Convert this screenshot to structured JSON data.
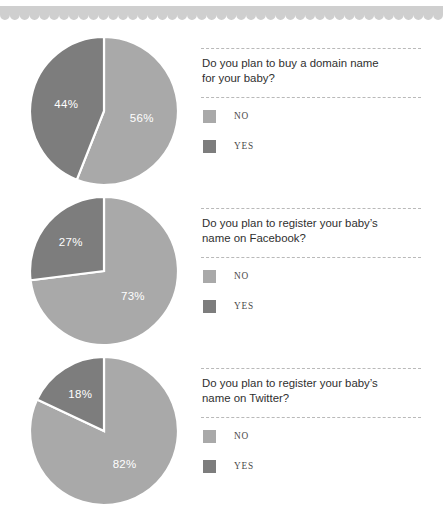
{
  "decoration": {
    "scallop_color": "#cfcfcf",
    "scallop_count": 45
  },
  "palette": {
    "no_color": "#a9a9a9",
    "yes_color": "#7d7d7d",
    "divider_color": "#ffffff",
    "label_color": "#ffffff",
    "rule_color": "#b9b9b9",
    "question_color": "#2f2f2f",
    "legend_text_color": "#4a4a4a"
  },
  "legend_labels": {
    "no": "NO",
    "yes": "YES"
  },
  "chart_data": [
    {
      "type": "pie",
      "title": "Do you plan to buy a domain name for your baby?",
      "question_line1": "Do you plan to buy a domain name",
      "question_line2": "for your baby?",
      "categories": [
        "NO",
        "YES"
      ],
      "values": [
        56,
        44
      ],
      "labels": [
        "56%",
        "44%"
      ],
      "colors": [
        "#a9a9a9",
        "#7d7d7d"
      ],
      "legend": [
        "NO",
        "YES"
      ],
      "legend_position": "right"
    },
    {
      "type": "pie",
      "title": "Do you plan to register your baby's name on Facebook?",
      "question_line1": "Do you plan to register your baby’s",
      "question_line2": "name on Facebook?",
      "categories": [
        "NO",
        "YES"
      ],
      "values": [
        73,
        27
      ],
      "labels": [
        "73%",
        "27%"
      ],
      "colors": [
        "#a9a9a9",
        "#7d7d7d"
      ],
      "legend": [
        "NO",
        "YES"
      ],
      "legend_position": "right"
    },
    {
      "type": "pie",
      "title": "Do you plan to register your baby's name on Twitter?",
      "question_line1": "Do you plan to register your baby’s",
      "question_line2": "name on Twitter?",
      "categories": [
        "NO",
        "YES"
      ],
      "values": [
        82,
        18
      ],
      "labels": [
        "82%",
        "18%"
      ],
      "colors": [
        "#a9a9a9",
        "#7d7d7d"
      ],
      "legend": [
        "NO",
        "YES"
      ],
      "legend_position": "right"
    }
  ]
}
